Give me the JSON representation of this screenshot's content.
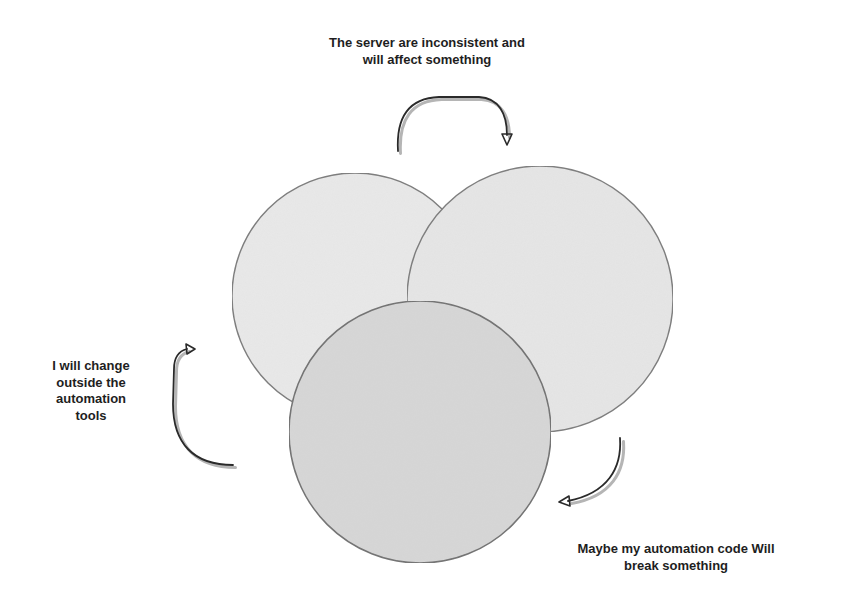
{
  "diagram": {
    "type": "overlapping-circles-cycle",
    "colors": {
      "background": "#ffffff",
      "circle_light_fill": "#e9e9e9",
      "circle_dark_fill": "#d7d7d7",
      "circle_stroke": "#7a7a7a",
      "arrow_color": "#2a2a2a",
      "text_color": "#1e1e1e"
    },
    "circles": [
      {
        "name": "left-circle",
        "cx": 355,
        "cy": 296,
        "r": 123,
        "fill": "#e9e9e9"
      },
      {
        "name": "right-circle",
        "cx": 540,
        "cy": 299,
        "r": 133,
        "fill": "#e6e6e6"
      },
      {
        "name": "bottom-circle",
        "cx": 420,
        "cy": 432,
        "r": 131,
        "fill": "#d7d7d7"
      }
    ],
    "labels": {
      "top": {
        "lines": [
          "The server are inconsistent and",
          "will affect something"
        ]
      },
      "left": {
        "lines": [
          "I will change",
          "outside the",
          "automation",
          "tools"
        ]
      },
      "bottom_right": {
        "lines": [
          "Maybe my automation code Will",
          "break something"
        ]
      }
    },
    "arrows": [
      {
        "name": "top-arrow",
        "direction": "clockwise-right-down"
      },
      {
        "name": "bottom-right-arrow",
        "direction": "down-left"
      },
      {
        "name": "left-arrow",
        "direction": "up-right"
      }
    ]
  }
}
